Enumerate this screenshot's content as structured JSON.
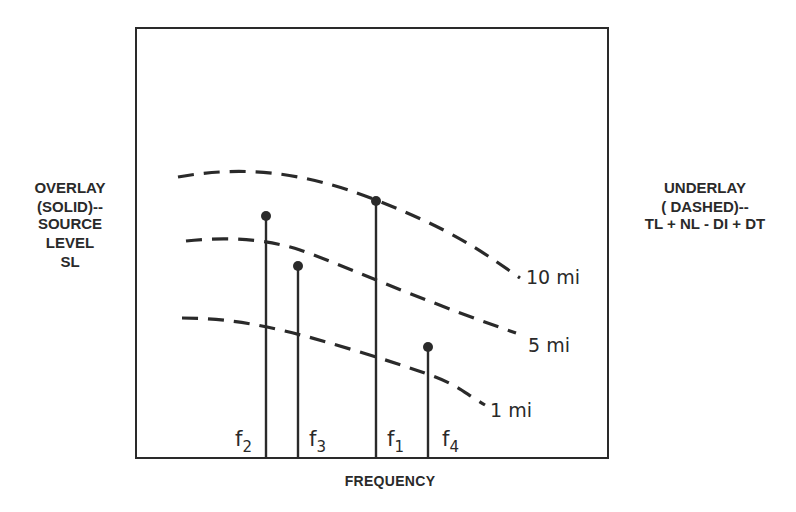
{
  "left_labels": {
    "overlay": "OVERLAY",
    "overlay_sub": "(SOLID)--",
    "source1": "SOURCE",
    "source2": "LEVEL",
    "source3": "SL"
  },
  "right_labels": {
    "underlay": "UNDERLAY",
    "underlay_sub": "( DASHED)--",
    "equation": "TL + NL - DI + DT"
  },
  "x_axis_label": "FREQUENCY",
  "curves": [
    {
      "label": "10 mi"
    },
    {
      "label": "5 mi"
    },
    {
      "label": "1 mi"
    }
  ],
  "stems": [
    {
      "name": "f",
      "sub": "2"
    },
    {
      "name": "f",
      "sub": "3"
    },
    {
      "name": "f",
      "sub": "1"
    },
    {
      "name": "f",
      "sub": "4"
    }
  ],
  "colors": {
    "ink": "#2a2a2a",
    "background": "#ffffff"
  }
}
